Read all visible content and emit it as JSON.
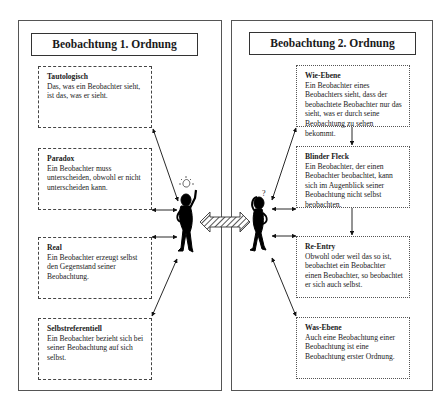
{
  "left_panel": {
    "title": "Beobachtung 1. Ordnung",
    "cards": [
      {
        "title": "Tautologisch",
        "text": "Das, was ein Beobachter sieht, ist das, was er sieht."
      },
      {
        "title": "Paradox",
        "text": "Ein Beobachter muss unterscheiden, obwohl er nicht unterscheiden kann."
      },
      {
        "title": "Real",
        "text": "Ein Beobachter erzeugt selbst den Gegenstand seiner Beobachtung."
      },
      {
        "title": "Selbstreferentiell",
        "text": "Ein Beobachter bezieht sich bei seiner Beobachtung auf sich selbst."
      }
    ],
    "figure": {
      "icon": "observer-with-lightbulb-icon",
      "symbol": "lightbulb"
    }
  },
  "right_panel": {
    "title": "Beobachtung 2. Ordnung",
    "cards": [
      {
        "title": "Wie-Ebene",
        "text": "Ein Beobachter eines Beobachters sieht, dass der beobachtete Beobachter nur das sieht, was er durch seine Beobachtung zu sehen bekommt."
      },
      {
        "title": "Blinder Fleck",
        "text": "Ein Beobachter, der einen Beobachter beobachtet, kann sich im Augenblick seiner Beobachtung nicht selbst beobachten."
      },
      {
        "title": "Re-Entry",
        "text": "Obwohl oder weil das so ist, beobachtet ein Beobachter einen Beobachter, so beobachtet er sich auch selbst."
      },
      {
        "title": "Was-Ebene",
        "text": "Auch eine Beobachtung einer Beobachtung ist eine Beobachtung erster Ordnung."
      }
    ],
    "figure": {
      "icon": "observer-with-question-mark-icon",
      "symbol": "?"
    }
  },
  "connector": {
    "icon": "hatched-double-arrow-icon"
  }
}
